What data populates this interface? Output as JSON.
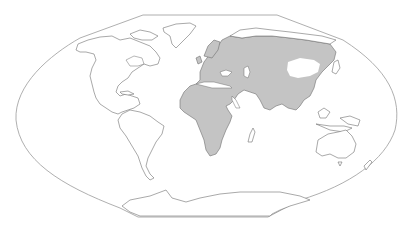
{
  "map": {
    "type": "world distribution map",
    "projection": "pseudo-elliptical world projection with flattened poles",
    "colors": {
      "background": "#ffffff",
      "land_fill": "#ffffff",
      "range_fill": "#c4c4c4",
      "coastline": "#6f6f6f",
      "frame": "#9a9a9a"
    },
    "shaded_range": {
      "label": "Shaded distribution range",
      "regions": [
        "Africa",
        "Europe",
        "Middle East",
        "South Asia",
        "Central & East Asia",
        "Southeast Asia"
      ],
      "unshaded_gap": "Central Asian plateau / Gobi region"
    },
    "continents": [
      {
        "name": "North America",
        "shaded": false
      },
      {
        "name": "Greenland",
        "shaded": false
      },
      {
        "name": "South America",
        "shaded": false
      },
      {
        "name": "Africa",
        "shaded": true
      },
      {
        "name": "Madagascar",
        "shaded": false
      },
      {
        "name": "Eurasia",
        "shaded": true
      },
      {
        "name": "Japan",
        "shaded": false
      },
      {
        "name": "Maritime Southeast Asia",
        "shaded": false
      },
      {
        "name": "Australia",
        "shaded": false
      },
      {
        "name": "New Zealand",
        "shaded": false
      },
      {
        "name": "Antarctica",
        "shaded": false
      }
    ]
  }
}
